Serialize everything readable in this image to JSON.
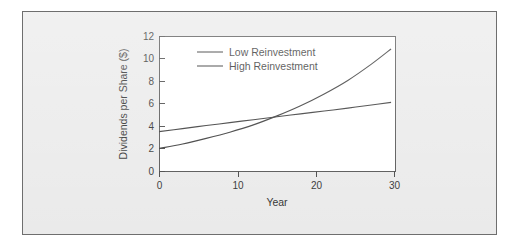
{
  "figure": {
    "background_color": "#e9e9e9",
    "border_color": "#6e6e6e",
    "plot_background_color": "#ffffff"
  },
  "chart_data": {
    "type": "line",
    "title": "",
    "subtitle": "",
    "xlabel": "Year",
    "ylabel": "Dividends per Share ($)",
    "xlim": [
      0,
      30
    ],
    "ylim": [
      0,
      12
    ],
    "xticks": [
      0,
      10,
      20,
      30
    ],
    "xtick_labels": [
      "0",
      "10",
      "20",
      "30"
    ],
    "yticks": [
      0,
      2,
      4,
      6,
      8,
      10,
      12
    ],
    "ytick_labels": [
      "0",
      "2",
      "4",
      "6",
      "8",
      "10",
      "12"
    ],
    "grid": false,
    "legend_position": "upper-left-inside",
    "line_color": "#2b2b2b",
    "x": [
      0,
      3,
      6,
      9,
      12,
      15,
      18,
      21,
      24,
      27,
      29.5
    ],
    "series": [
      {
        "name": "Low Reinvestment",
        "values": [
          3.5,
          3.77,
          4.04,
          4.3,
          4.56,
          4.82,
          5.08,
          5.33,
          5.59,
          5.87,
          6.1
        ]
      },
      {
        "name": "High Reinvestment",
        "values": [
          2.0,
          2.4,
          2.9,
          3.45,
          4.1,
          4.9,
          5.8,
          6.85,
          8.05,
          9.5,
          10.85
        ]
      }
    ],
    "annotations": [
      "Curves cross near Year 13.5 at about $4.6"
    ]
  },
  "legend": {
    "entries": [
      {
        "label": "Low Reinvestment"
      },
      {
        "label": "High Reinvestment"
      }
    ]
  }
}
